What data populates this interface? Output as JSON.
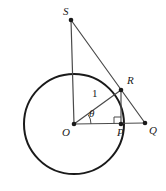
{
  "figure": {
    "type": "geometry-diagram",
    "background_color": "#ffffff",
    "stroke_color": "#1a1a1a",
    "thin_stroke_color": "#4a4a4a",
    "width": 166,
    "height": 191
  },
  "circle": {
    "name": "unit-circle",
    "center_label": "O",
    "cx": 74,
    "cy": 124,
    "r": 50,
    "stroke_width": 2
  },
  "points": [
    {
      "id": "S",
      "label": "S",
      "x": 71,
      "y": 20,
      "label_x": 63,
      "label_y": 6,
      "dot": true
    },
    {
      "id": "R",
      "label": "R",
      "x": 121,
      "y": 90,
      "label_x": 127,
      "label_y": 75,
      "dot": true
    },
    {
      "id": "O",
      "label": "O",
      "x": 74,
      "y": 124,
      "label_x": 62,
      "label_y": 127,
      "dot": true
    },
    {
      "id": "P",
      "label": "P",
      "x": 121,
      "y": 124,
      "label_x": 117,
      "label_y": 127,
      "dot": true
    },
    {
      "id": "Q",
      "label": "Q",
      "x": 145,
      "y": 123,
      "label_x": 149,
      "label_y": 125,
      "dot": true
    }
  ],
  "segments": [
    {
      "id": "SO",
      "name": "segment-s-o",
      "from": "S",
      "to": "O",
      "width": 1.2
    },
    {
      "id": "SQ",
      "name": "segment-s-q",
      "from": "S",
      "to": "Q",
      "width": 1.2
    },
    {
      "id": "OR",
      "name": "radius-o-r",
      "from": "O",
      "to": "R",
      "width": 1.2
    },
    {
      "id": "OQ",
      "name": "segment-o-q",
      "from": "O",
      "to": "Q",
      "width": 1.2
    },
    {
      "id": "RP",
      "name": "segment-r-p",
      "from": "R",
      "to": "P",
      "width": 1.2
    }
  ],
  "measure_labels": [
    {
      "id": "radius-one",
      "text": "1",
      "x": 92,
      "y": 88,
      "italic": false
    },
    {
      "id": "angle-theta",
      "text": "θ",
      "x": 89,
      "y": 108,
      "italic": true
    }
  ],
  "angle_marks": [
    {
      "id": "theta-arc",
      "name": "theta-angle-arc",
      "vertex": "O",
      "radius": 17,
      "start_deg": 0,
      "end_deg": 34
    }
  ],
  "right_angle_marks": [
    {
      "id": "right-angle-p",
      "name": "right-angle-mark-at-p",
      "vertex": "P",
      "size": 7,
      "dir_x": -1,
      "dir_y": -1
    }
  ]
}
